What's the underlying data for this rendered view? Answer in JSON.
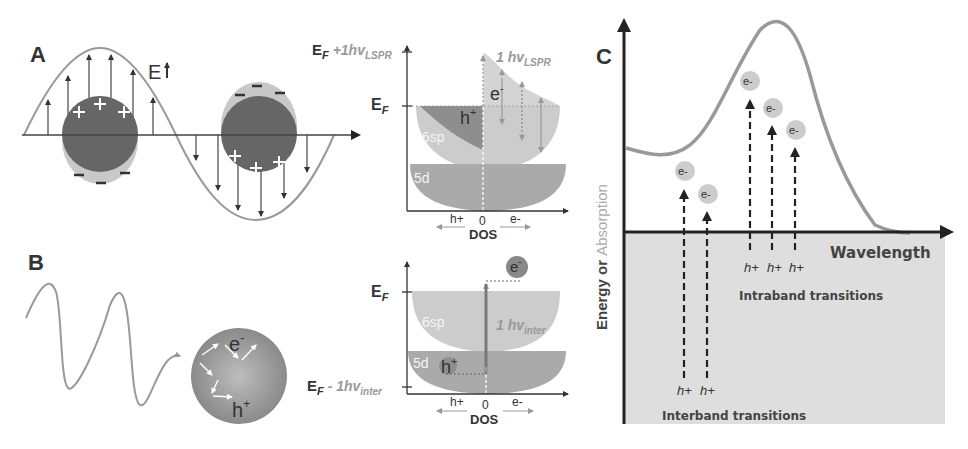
{
  "figure": {
    "panels": {
      "A": {
        "label": "A",
        "field_label": "E",
        "dos": {
          "top_label_main": "E",
          "top_label_sub": "F",
          "top_label_extra": " +1hv",
          "top_label_extra_sub": "LSPR",
          "ef_label": "E",
          "ef_sub": "F",
          "photon_label": "1 hv",
          "photon_sub": "LSPR",
          "band_6sp": "6sp",
          "band_5d": "5d",
          "hole": "h",
          "hole_sup": "+",
          "electron": "e",
          "electron_sup": "-",
          "axis_left": "h+",
          "axis_zero": "0",
          "axis_right": "e-",
          "axis_title": "DOS"
        }
      },
      "B": {
        "label": "B",
        "particle_electron": "e",
        "particle_electron_sup": "-",
        "particle_hole": "h",
        "particle_hole_sup": "+",
        "dos": {
          "ef_label": "E",
          "ef_sub": "F",
          "bottom_label_main": "E",
          "bottom_label_sub": "F",
          "bottom_label_extra": " - 1hv",
          "bottom_label_extra_sub": "inter",
          "photon_label": "1 hv",
          "photon_sub": "inter",
          "band_6sp": "6sp",
          "band_5d": "5d",
          "hole": "h",
          "hole_sup": "+",
          "electron": "e",
          "electron_sup": "-",
          "axis_left": "h+",
          "axis_zero": "0",
          "axis_right": "e-",
          "axis_title": "DOS"
        }
      },
      "C": {
        "label": "C",
        "y_axis_label_1": "Energy or ",
        "y_axis_label_2": "Absorption",
        "x_axis_label": "Wavelength",
        "electron": "e-",
        "hole": "h+",
        "intraband_caption": "Intraband transitions",
        "interband_caption": "Interband transitions"
      }
    },
    "colors": {
      "curve": "#999999",
      "dark_sphere": "#666666",
      "halo": "#c8c8c8",
      "band_6sp": "#cccccc",
      "band_5d": "#aaaaaa",
      "hole_region": "#8a8a8a",
      "axis": "#333333",
      "shaded": "#dedede"
    }
  }
}
